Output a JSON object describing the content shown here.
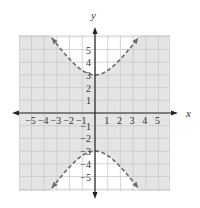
{
  "chart_data": {
    "type": "line",
    "title": "",
    "xlabel": "x",
    "ylabel": "y",
    "xlim": [
      -6,
      6
    ],
    "ylim": [
      -6.2,
      6.2
    ],
    "grid": true,
    "x_ticks": [
      -5,
      -4,
      -3,
      -2,
      -1,
      1,
      2,
      3,
      4,
      5
    ],
    "y_ticks": [
      5,
      4,
      3,
      2,
      1,
      -1,
      -2,
      -3,
      -4,
      -5
    ],
    "x_tick_labels": [
      "−5",
      "−4",
      "−3",
      "−2",
      "−1",
      "1",
      "2",
      "3",
      "4",
      "5"
    ],
    "y_tick_labels": [
      "5",
      "4",
      "3",
      "2",
      "1",
      "−1",
      "−2",
      "−3",
      "−4",
      "−5"
    ],
    "series": [
      {
        "name": "hyperbola upper branch",
        "equation": "y^2/9 - x^2/4 = 1",
        "style": "dashed",
        "x": [
          -3.4,
          -3,
          -2,
          -1,
          0,
          1,
          2,
          3,
          3.4
        ],
        "y": [
          5.9,
          5.41,
          4.24,
          3.35,
          3.0,
          3.35,
          4.24,
          5.41,
          5.9
        ]
      },
      {
        "name": "hyperbola lower branch",
        "equation": "y^2/9 - x^2/4 = 1",
        "style": "dashed",
        "x": [
          -3.4,
          -3,
          -2,
          -1,
          0,
          1,
          2,
          3,
          3.4
        ],
        "y": [
          -5.9,
          -5.41,
          -4.24,
          -3.35,
          -3.0,
          -3.35,
          -4.24,
          -5.41,
          -5.9
        ]
      }
    ],
    "shaded_region": "between the branches: y^2/9 - x^2/4 < 1",
    "vertices": [
      [
        0,
        3
      ],
      [
        0,
        -3
      ]
    ],
    "a": 3,
    "b": 2
  },
  "layout": {
    "origin_px": [
      95,
      113
    ],
    "unit_px": 12.7,
    "grid_box": {
      "left": 19,
      "top": 35,
      "right": 170,
      "bottom": 191
    },
    "x_axis_span": [
      12,
      178
    ],
    "y_axis_span": [
      27,
      199
    ],
    "branch_x_extent": 3.4
  },
  "colors": {
    "shade": "#e4e4e4",
    "grid": "#c9c9c9",
    "grid_unshaded": "#dddddd",
    "axis": "#222222",
    "curve": "#6a6a6a",
    "text": "#333333"
  }
}
